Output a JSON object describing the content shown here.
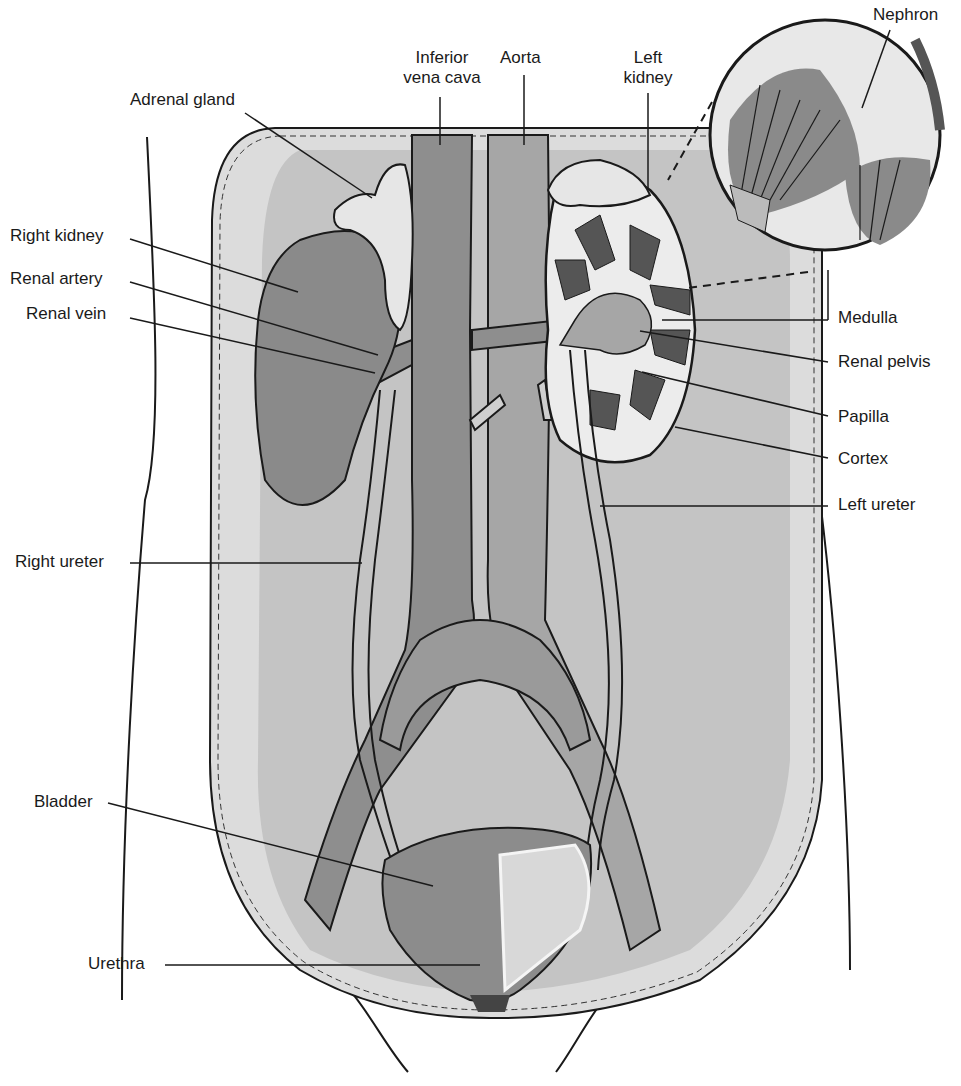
{
  "figure": {
    "colors": {
      "background": "#ffffff",
      "abdomen_outer": "#dcdcdc",
      "abdomen_inner": "#c4c4c4",
      "vessel": "#8e8e8e",
      "vessel_light": "#a6a6a6",
      "kidney": "#8a8a8a",
      "adrenal": "#e6e6e6",
      "ureter": "#cfcfcf",
      "bladder": "#8c8c8c",
      "outline": "#1a1a1a"
    }
  },
  "labels": {
    "adrenal_gland": "Adrenal gland",
    "inferior_vena_cava_line1": "Inferior",
    "inferior_vena_cava_line2": "vena cava",
    "aorta": "Aorta",
    "left_kidney_line1": "Left",
    "left_kidney_line2": "kidney",
    "nephron": "Nephron",
    "right_kidney": "Right kidney",
    "renal_artery": "Renal artery",
    "renal_vein": "Renal vein",
    "medulla": "Medulla",
    "renal_pelvis": "Renal pelvis",
    "papilla": "Papilla",
    "cortex": "Cortex",
    "left_ureter": "Left ureter",
    "right_ureter": "Right ureter",
    "bladder": "Bladder",
    "urethra": "Urethra"
  }
}
